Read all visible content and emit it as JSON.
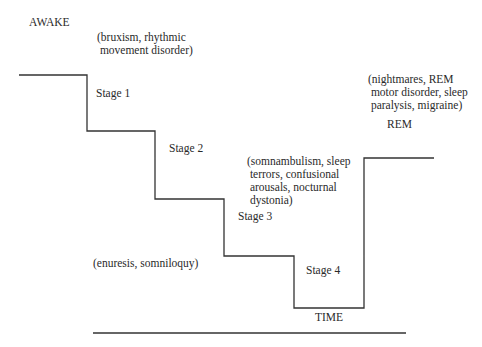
{
  "diagram": {
    "stages": [
      {
        "label": "AWAKE",
        "disorders": "(bruxism, rhythmic\n movement disorder)"
      },
      {
        "label": "Stage 1"
      },
      {
        "label": "Stage 2"
      },
      {
        "label": "Stage 3",
        "disorders": "(somnambulism, sleep\n terrors, confusional\n arousals, nocturnal\n dystonia)"
      },
      {
        "label": "Stage 4"
      },
      {
        "label": "REM",
        "disorders": "(nightmares, REM\n motor disorder, sleep\n paralysis, migraine)"
      }
    ],
    "other_disorders": "(enuresis, somniloquy)",
    "axis_label": "TIME",
    "line_color": "#333333"
  }
}
